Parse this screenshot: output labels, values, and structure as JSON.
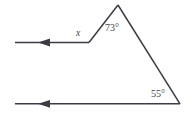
{
  "figure": {
    "background_color": "#ffffff",
    "stroke_color": "#3c3c46",
    "text_color": "#434349",
    "labels": {
      "unknown_angle": "x",
      "apex_angle": "73°",
      "base_angle": "55°"
    },
    "label_values": {
      "unknown_angle_value": "x",
      "apex_angle_value": 73,
      "base_angle_value": 55,
      "angle_unit": "degrees"
    },
    "geometry": {
      "apex_point": [
        118,
        5
      ],
      "upper_vertex_point": [
        89,
        42
      ],
      "lower_right_vertex_point": [
        180,
        104
      ],
      "upper_ray_start": [
        15,
        42
      ],
      "lower_ray_start": [
        15,
        104
      ],
      "upper_arrow_tip": [
        38,
        42
      ],
      "lower_arrow_tip": [
        38,
        104
      ],
      "arrow_direction": "left"
    }
  }
}
